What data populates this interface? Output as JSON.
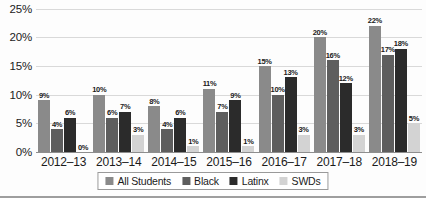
{
  "chart_data": {
    "type": "bar",
    "title": "",
    "subtitle": "",
    "xlabel": "",
    "ylabel": "",
    "categories": [
      "2012–13",
      "2013–14",
      "2014–15",
      "2015–16",
      "2016–17",
      "2017–18",
      "2018–19"
    ],
    "series": [
      {
        "name": "All Students",
        "color": "#8a8a8a",
        "values": [
          9,
          10,
          8,
          11,
          15,
          20,
          22
        ],
        "labels": [
          "9%",
          "10%",
          "8%",
          "11%",
          "15%",
          "20%",
          "22%"
        ]
      },
      {
        "name": "Black",
        "color": "#5e5e5e",
        "values": [
          4,
          6,
          4,
          7,
          10,
          16,
          17
        ],
        "labels": [
          "4%",
          "6%",
          "4%",
          "7%",
          "10%",
          "16%",
          "17%"
        ]
      },
      {
        "name": "Latinx",
        "color": "#2b2b2b",
        "values": [
          6,
          7,
          6,
          9,
          13,
          12,
          18
        ],
        "labels": [
          "6%",
          "7%",
          "6%",
          "9%",
          "13%",
          "12%",
          "18%"
        ]
      },
      {
        "name": "SWDs",
        "color": "#d3d3d3",
        "values": [
          0,
          3,
          1,
          1,
          3,
          3,
          5
        ],
        "labels": [
          "0%",
          "3%",
          "1%",
          "1%",
          "3%",
          "3%",
          "5%"
        ]
      }
    ],
    "ylim": [
      0,
      30
    ],
    "yticks": [
      "0%",
      "5%",
      "10%",
      "15%",
      "20%",
      "25%",
      "30%"
    ],
    "ytick_values": [
      0,
      5,
      10,
      15,
      20,
      25,
      30
    ],
    "grid": true,
    "legend_position": "bottom",
    "legend": [
      "All Students",
      "Black",
      "Latinx",
      "SWDs"
    ]
  },
  "colors": {
    "all_students": "#8a8a8a",
    "black": "#5e5e5e",
    "latinx": "#2b2b2b",
    "swds": "#d3d3d3",
    "gridline": "#d9d9d9",
    "axis": "#8e8e8e",
    "text": "#1b1b1b"
  }
}
